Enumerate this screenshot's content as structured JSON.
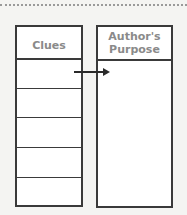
{
  "organizer": {
    "left_column": {
      "header": "Clues",
      "rows": [
        "",
        "",
        "",
        "",
        ""
      ]
    },
    "right_column": {
      "header": "Author's Purpose"
    },
    "arrow": "right-arrow"
  },
  "colors": {
    "border": "#3a3a3a",
    "header_text": "#8a8a8a",
    "background": "#f4f4f2"
  }
}
